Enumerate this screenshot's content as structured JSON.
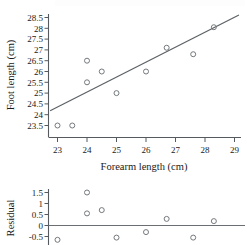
{
  "figure": {
    "background": "#ffffff",
    "ink_color": "#1a1a1a",
    "marker_color": "#74797d",
    "line_color": "#5b6165"
  },
  "scatter_panel": {
    "name": "foot-vs-forearm-scatterplot",
    "xlabel": "Forearm length (cm)",
    "ylabel": "Foot length (cm)",
    "x_ticks": [
      "23",
      "24",
      "25",
      "26",
      "27",
      "28",
      "29"
    ],
    "y_ticks": [
      "28.5",
      "28",
      "27.5",
      "27",
      "26.5",
      "26",
      "25.5",
      "25",
      "24.5",
      "24",
      "23.5"
    ]
  },
  "residual_panel": {
    "name": "residual-plot",
    "ylabel": "Residual",
    "y_ticks": [
      "1.5",
      "1",
      "0.5",
      "0",
      "-0.5"
    ]
  },
  "chart_data": [
    {
      "type": "scatter",
      "name": "foot-length-vs-forearm-length",
      "title": "",
      "xlabel": "Forearm length (cm)",
      "ylabel": "Foot length (cm)",
      "xlim": [
        22.7,
        29.3
      ],
      "ylim": [
        23.2,
        28.75
      ],
      "xticks": [
        23,
        24,
        25,
        26,
        27,
        28,
        29
      ],
      "yticks": [
        23.5,
        24,
        24.5,
        25,
        25.5,
        26,
        26.5,
        27,
        27.5,
        28,
        28.5
      ],
      "grid": false,
      "legend": "none",
      "points": [
        {
          "x": 23.0,
          "y": 23.5
        },
        {
          "x": 23.5,
          "y": 23.5
        },
        {
          "x": 24.0,
          "y": 26.5
        },
        {
          "x": 24.0,
          "y": 25.5
        },
        {
          "x": 24.5,
          "y": 26.0
        },
        {
          "x": 25.0,
          "y": 25.0
        },
        {
          "x": 26.0,
          "y": 26.0
        },
        {
          "x": 26.7,
          "y": 27.1
        },
        {
          "x": 27.6,
          "y": 26.8
        },
        {
          "x": 28.3,
          "y": 28.05
        }
      ],
      "fit_line": {
        "name": "least-squares-regression-line",
        "x_start": 22.75,
        "y_start": 24.18,
        "x_end": 29.15,
        "y_end": 28.62
      }
    },
    {
      "type": "scatter",
      "name": "residuals-vs-forearm-length",
      "title": "",
      "xlabel": "",
      "ylabel": "Residual",
      "xlim": [
        22.7,
        29.3
      ],
      "ylim": [
        -0.85,
        1.8
      ],
      "yticks": [
        1.5,
        1,
        0.5,
        0,
        -0.5
      ],
      "grid": false,
      "legend": "none",
      "zero_line": 0,
      "points": [
        {
          "x": 23.0,
          "y": -0.65
        },
        {
          "x": 24.0,
          "y": 1.5
        },
        {
          "x": 24.0,
          "y": 0.55
        },
        {
          "x": 24.5,
          "y": 0.7
        },
        {
          "x": 25.0,
          "y": -0.55
        },
        {
          "x": 26.0,
          "y": -0.3
        },
        {
          "x": 26.7,
          "y": 0.3
        },
        {
          "x": 27.6,
          "y": -0.55
        },
        {
          "x": 28.3,
          "y": 0.2
        }
      ]
    }
  ]
}
